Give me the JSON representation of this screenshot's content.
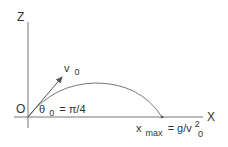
{
  "diagram": {
    "type": "projectile-motion",
    "axes": {
      "vertical_label": "Z",
      "horizontal_label": "X",
      "origin_label": "O"
    },
    "velocity": {
      "symbol": "v",
      "subscript": "0"
    },
    "angle": {
      "symbol": "θ",
      "subscript": "0",
      "equals": "= π/4"
    },
    "range": {
      "symbol": "x",
      "subscript": "max",
      "equals": "= g/v",
      "superscript": "2",
      "sub2": "0"
    },
    "colors": {
      "line": "#777777",
      "text": "#333333",
      "background": "#ffffff"
    }
  }
}
